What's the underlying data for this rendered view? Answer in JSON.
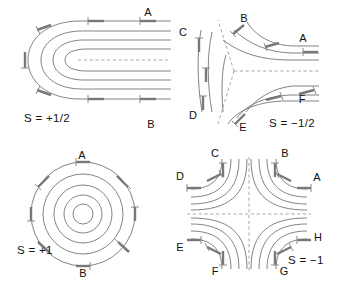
{
  "figure": {
    "background_color": "#ffffff",
    "line_color": "#6d6d6d",
    "dash_color": "#9a9a9a",
    "director_color": "#787878",
    "label_color": "#111111",
    "width": 343,
    "height": 283
  },
  "panels": [
    {
      "id": "s-plus-half",
      "strength_label": "S = +1/2",
      "strength_value": 0.5,
      "position": "top-left",
      "pattern": "nested-u-curves",
      "label_x": 24,
      "label_y": 122,
      "point_labels": [
        {
          "text": "A",
          "x": 148,
          "y": 16
        },
        {
          "text": "B",
          "x": 151,
          "y": 128
        }
      ],
      "dashed_centerline": true,
      "curve_count": 5
    },
    {
      "id": "s-minus-half",
      "strength_label": "S = −1/2",
      "strength_value": -0.5,
      "position": "top-right",
      "pattern": "three-fold-hyperbolic",
      "label_x": 98,
      "label_y": 127,
      "point_labels": [
        {
          "text": "A",
          "x": 132,
          "y": 42
        },
        {
          "text": "B",
          "x": 73,
          "y": 22
        },
        {
          "text": "C",
          "x": 12,
          "y": 36
        },
        {
          "text": "D",
          "x": 22,
          "y": 119
        },
        {
          "text": "E",
          "x": 72,
          "y": 131
        },
        {
          "text": "F",
          "x": 131,
          "y": 103
        }
      ],
      "separatrix_count": 3,
      "curve_count": 7
    },
    {
      "id": "s-plus-one",
      "strength_label": "S = +1",
      "strength_value": 1.0,
      "position": "bottom-left",
      "pattern": "concentric-circles",
      "label_x": 17,
      "label_y": 113,
      "point_labels": [
        {
          "text": "A",
          "x": 82,
          "y": 18
        },
        {
          "text": "B",
          "x": 83,
          "y": 132
        }
      ],
      "circle_count": 5,
      "director_count": 8
    },
    {
      "id": "s-minus-one",
      "strength_label": "S = −1",
      "strength_value": -1.0,
      "position": "bottom-right",
      "pattern": "four-fold-hyperbolic",
      "label_x": 117,
      "label_y": 118,
      "point_labels": [
        {
          "text": "A",
          "x": 138,
          "y": 38
        },
        {
          "text": "B",
          "x": 112,
          "y": 15
        },
        {
          "text": "C",
          "x": 44,
          "y": 14
        },
        {
          "text": "D",
          "x": 12,
          "y": 36
        },
        {
          "text": "E",
          "x": 10,
          "y": 106
        },
        {
          "text": "F",
          "x": 44,
          "y": 131
        },
        {
          "text": "G",
          "x": 111,
          "y": 131
        },
        {
          "text": "H",
          "x": 139,
          "y": 97
        }
      ],
      "dashed_axes": 2,
      "curve_count": 12
    }
  ]
}
